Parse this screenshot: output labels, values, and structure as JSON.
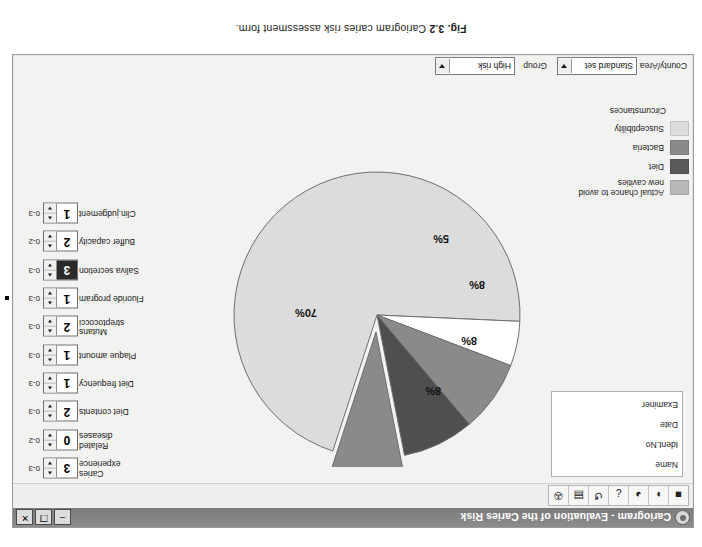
{
  "figure": {
    "number": "Fig. 3.2",
    "caption": "Cariogram caries risk assessment form."
  },
  "window": {
    "title": "Cariogram - Evaluation of the Caries Risk",
    "app_icon": "cariogram-app-icon",
    "controls": {
      "minimize": "–",
      "maximize": "❐",
      "close": "✕"
    }
  },
  "toolbar": {
    "buttons": [
      {
        "name": "new-record-icon",
        "glyph": "■"
      },
      {
        "name": "open-folder-icon",
        "glyph": "◗"
      },
      {
        "name": "pie-chart-icon",
        "glyph": "◕"
      },
      {
        "name": "info-icon",
        "glyph": "¿"
      },
      {
        "name": "refresh-icon",
        "glyph": "↺"
      },
      {
        "name": "save-icon",
        "glyph": "▤"
      },
      {
        "name": "print-icon",
        "glyph": "✇"
      }
    ]
  },
  "patient_info": {
    "fields": [
      {
        "label": "Name",
        "value": ""
      },
      {
        "label": "Ident.No",
        "value": ""
      },
      {
        "label": "Date",
        "value": ""
      },
      {
        "label": "Examiner",
        "value": ""
      }
    ]
  },
  "selectors": [
    {
      "label": "County/Area",
      "value": "Standard set"
    },
    {
      "label": "Group",
      "value": "High risk"
    }
  ],
  "factors": [
    {
      "label": "Caries\nexperience",
      "value": "3",
      "range": "0-3",
      "selected": false,
      "marker": false
    },
    {
      "label": "Related\ndiseases",
      "value": "0",
      "range": "0-2",
      "selected": false,
      "marker": false
    },
    {
      "label": "Diet contents",
      "value": "2",
      "range": "0-3",
      "selected": false,
      "marker": false
    },
    {
      "label": "Diet frequency",
      "value": "1",
      "range": "0-3",
      "selected": false,
      "marker": false
    },
    {
      "label": "Plaque amount",
      "value": "1",
      "range": "0-3",
      "selected": false,
      "marker": false
    },
    {
      "label": "Mutans\nstreptococci",
      "value": "2",
      "range": "0-3",
      "selected": false,
      "marker": false
    },
    {
      "label": "Fluoride program",
      "value": "1",
      "range": "0-3",
      "selected": false,
      "marker": true
    },
    {
      "label": "Saliva secretion",
      "value": "3",
      "range": "0-3",
      "selected": true,
      "marker": false
    },
    {
      "label": "Buffer capacity",
      "value": "2",
      "range": "0-2",
      "selected": false,
      "marker": false
    },
    {
      "label": "Clin.judgement",
      "value": "1",
      "range": "0-3",
      "selected": false,
      "marker": false
    }
  ],
  "legend": {
    "items": [
      {
        "label": "Actual chance to avoid\nnew cavities",
        "color": "#b8b8b8"
      },
      {
        "label": "Diet",
        "color": "#5a5a5a"
      },
      {
        "label": "Bacteria",
        "color": "#8a8a8a"
      },
      {
        "label": "Susceptibility",
        "color": "#dcdcdc"
      },
      {
        "label": "Circumstances",
        "color": ""
      }
    ]
  },
  "chart_data": {
    "type": "pie",
    "labels": [
      "Actual chance to avoid new cavities",
      "Circumstances",
      "Diet",
      "Bacteria",
      "Susceptibility"
    ],
    "values": [
      70,
      5,
      8,
      8,
      8
    ],
    "display_labels": [
      "70%",
      "5%",
      "8%",
      "8%",
      "8%"
    ],
    "colors": [
      "#dcdcdc",
      "#ffffff",
      "#8a8a8a",
      "#4f4f4f",
      "#8a8a8a"
    ],
    "exploded": [
      false,
      false,
      false,
      false,
      true
    ],
    "legend_position": "top-right",
    "grid": false
  }
}
